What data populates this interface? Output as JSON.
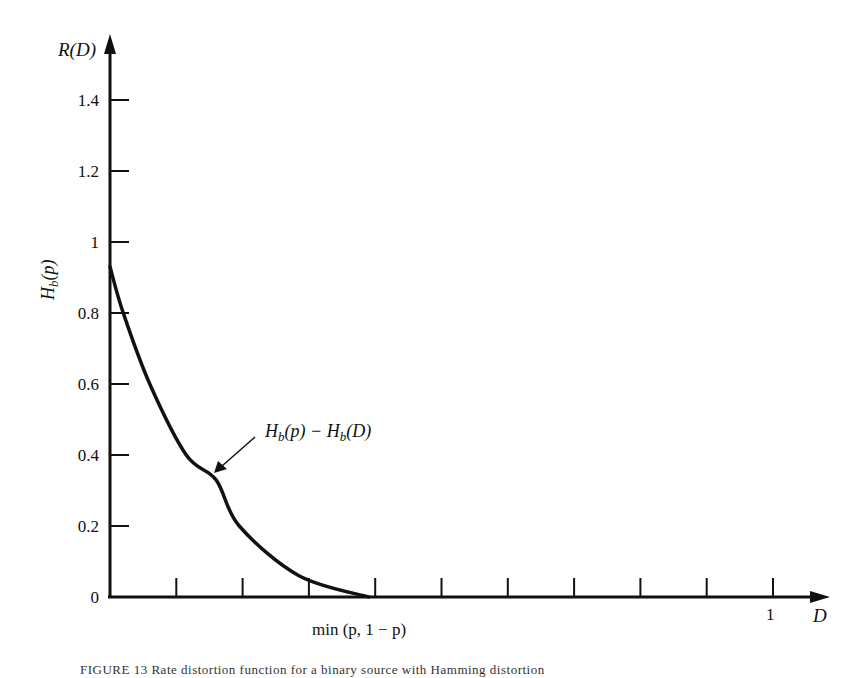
{
  "figure": {
    "caption": "FIGURE 13  Rate distortion function for a binary source with Hamming distortion"
  },
  "chart_data": {
    "type": "line",
    "title": "",
    "xlabel": "D",
    "ylabel": "R(D)",
    "y_axis_side_label": "H_b(p)",
    "xlim": [
      0,
      1.0
    ],
    "ylim": [
      0,
      1.5
    ],
    "grid": false,
    "y_ticks": [
      0,
      0.2,
      0.4,
      0.6,
      0.8,
      1,
      1.2,
      1.4
    ],
    "y_tick_labels": [
      "0",
      "0.2",
      "0.4",
      "0.6",
      "0.8",
      "1",
      "1.2",
      "1.4"
    ],
    "x_ticks": [
      0.1,
      0.2,
      0.3,
      0.4,
      0.5,
      0.6,
      0.7,
      0.8,
      0.9,
      1.0
    ],
    "x_tick_labels": {
      "0.39": "min (p, 1 − p)",
      "1.0": "1"
    },
    "series": [
      {
        "name": "H_b(p) − H_b(D)",
        "x": [
          0.0,
          0.02,
          0.06,
          0.115,
          0.16,
          0.195,
          0.285,
          0.39
        ],
        "y": [
          0.93,
          0.8,
          0.6,
          0.4,
          0.33,
          0.2,
          0.06,
          0.0
        ]
      }
    ],
    "annotations": [
      {
        "text": "H_b(p) − H_b(D)",
        "arrow_to": [
          0.16,
          0.33
        ]
      },
      {
        "text": "H_b(p)",
        "position": "y-axis at 0.93"
      }
    ]
  },
  "labels": {
    "r_d": "R(D)",
    "d": "D",
    "hbp": "H",
    "hbp_sub": "b",
    "hbp_rest": "(p)",
    "curve_label_a": "H",
    "curve_label_b": "b",
    "curve_label_c": "(p) − H",
    "curve_label_d": "b",
    "curve_label_e": "(D)",
    "min_label": "min (p, 1 − p)",
    "one": "1"
  }
}
